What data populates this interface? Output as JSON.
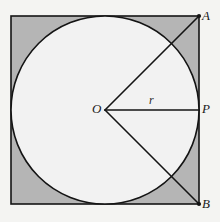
{
  "figure": {
    "canvas": {
      "width": 220,
      "height": 222,
      "background": "#f4f4f2"
    },
    "square": {
      "name": "bounding-square",
      "x": 11,
      "y": 16,
      "size": 188,
      "fill": "#b5b5b5",
      "stroke": "#141414",
      "stroke_width": 1.6
    },
    "circle": {
      "name": "inscribed-circle",
      "cx": 105,
      "cy": 110,
      "r": 94,
      "fill": "#f2f2f2",
      "stroke": "#141414",
      "stroke_width": 1.6
    },
    "points": [
      {
        "id": "A",
        "label": "A",
        "x": 199,
        "y": 16,
        "role": "top-right-corner"
      },
      {
        "id": "P",
        "label": "P",
        "x": 199,
        "y": 110,
        "role": "right-tangent-point"
      },
      {
        "id": "B",
        "label": "B",
        "x": 199,
        "y": 204,
        "role": "bottom-right-corner"
      },
      {
        "id": "O",
        "label": "O",
        "x": 105,
        "y": 110,
        "role": "circle-center"
      }
    ],
    "segments": [
      {
        "id": "OA",
        "from": "O",
        "to": "A",
        "label": "",
        "stroke": "#141414",
        "stroke_width": 1.6
      },
      {
        "id": "OP",
        "from": "O",
        "to": "P",
        "label": "r",
        "stroke": "#141414",
        "stroke_width": 1.6
      },
      {
        "id": "OB",
        "from": "O",
        "to": "B",
        "label": "",
        "stroke": "#141414",
        "stroke_width": 1.6
      }
    ],
    "labels": {
      "A": "A",
      "P": "P",
      "B": "B",
      "O": "O",
      "radius": "r"
    }
  }
}
